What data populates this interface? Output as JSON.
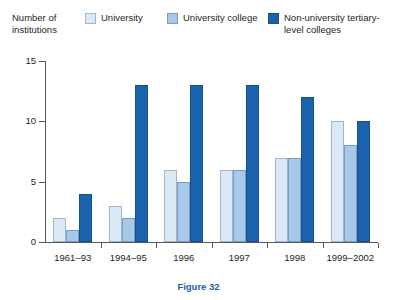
{
  "axis_title": "Number of\ninstitutions",
  "caption": "Figure 32",
  "legend": {
    "items": [
      {
        "label": "University",
        "color": "#dbe9f6",
        "swatch_name": "university-swatch"
      },
      {
        "label": "University college",
        "color": "#a8c8e8",
        "swatch_name": "university-college-swatch"
      },
      {
        "label": "Non-university tertiary-level colleges",
        "color": "#1b62ad",
        "swatch_name": "non-university-swatch"
      }
    ]
  },
  "chart_data": {
    "type": "bar",
    "title": "Figure 32",
    "xlabel": "",
    "ylabel": "Number of institutions",
    "ylim": [
      0,
      15
    ],
    "yticks": [
      0,
      5,
      10,
      15
    ],
    "grid": false,
    "legend_position": "top",
    "categories": [
      "1961–93",
      "1994–95",
      "1996",
      "1997",
      "1998",
      "1999–2002"
    ],
    "series": [
      {
        "name": "University",
        "color": "#dbe9f6",
        "values": [
          2,
          3,
          6,
          6,
          7,
          10
        ]
      },
      {
        "name": "University college",
        "color": "#a8c8e8",
        "values": [
          1,
          2,
          5,
          6,
          7,
          8
        ]
      },
      {
        "name": "Non-university tertiary-level colleges",
        "color": "#1b62ad",
        "values": [
          4,
          13,
          13,
          13,
          12,
          10
        ]
      }
    ]
  }
}
